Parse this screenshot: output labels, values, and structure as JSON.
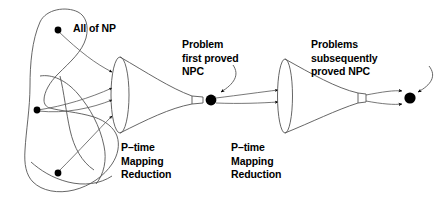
{
  "diagram": {
    "title_label": "All of NP",
    "labels": {
      "all_of_np": "All of NP",
      "first_proved_npc": "Problem\nfirst proved\nNPC",
      "subsequently_proved_npc": "Problems\nsubsequently\nproved NPC",
      "reduction_left": "P–time\nMapping\nReduction",
      "reduction_right": "P–time\nMapping\nReduction"
    },
    "colors": {
      "stroke": "#555555",
      "text": "#000000",
      "node_fill": "#000000",
      "background": "#ffffff",
      "arrow": "#000000"
    },
    "elements": {
      "np_blob": "irregular closed region labeled All of NP containing three problem nodes",
      "funnel_left": "p-time mapping reduction funnel, 4 incoming arrows, narrows to throat",
      "node_first_npc": "black dot, first problem proved NPC",
      "funnel_right": "second p-time mapping reduction funnel, 2 incoming arrows, narrows to throat",
      "node_subsequent_npc": "black dot, problems subsequently proved NPC"
    },
    "nodes": [
      {
        "name": "np-node-top",
        "cx": 58,
        "cy": 30
      },
      {
        "name": "np-node-middle",
        "cx": 37,
        "cy": 110
      },
      {
        "name": "np-node-bottom",
        "cx": 58,
        "cy": 173
      },
      {
        "name": "node-first-proved-npc",
        "cx": 211,
        "cy": 100
      },
      {
        "name": "node-subsequently-proved-npc",
        "cx": 410,
        "cy": 98
      }
    ],
    "arrow_counts": {
      "funnel_left_inputs": 4,
      "funnel_right_inputs": 2,
      "final_outputs": 2
    }
  }
}
